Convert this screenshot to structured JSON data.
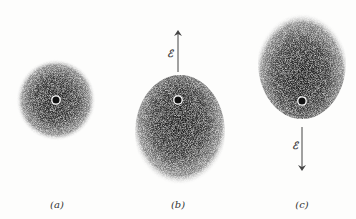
{
  "figure": {
    "panels": [
      {
        "id": "a",
        "label": "(a)",
        "description": "unperturbed atom, spherical electron cloud",
        "cloud": {
          "cx": 56,
          "cy": 100,
          "rx": 40,
          "ry": 41
        },
        "nucleus": {
          "cx": 56,
          "cy": 100
        },
        "label_pos": {
          "x": 57,
          "y": 199
        }
      },
      {
        "id": "b",
        "label": "(b)",
        "description": "field points up, cloud displaced downward",
        "cloud": {
          "cx": 180,
          "cy": 133,
          "rx": 45,
          "ry": 58
        },
        "nucleus": {
          "cx": 178,
          "cy": 100
        },
        "field": {
          "symbol": "ℰ",
          "direction": "up",
          "x": 178,
          "y1": 72,
          "y2": 33,
          "sym_x": 170,
          "sym_y": 53
        },
        "label_pos": {
          "x": 178,
          "y": 199
        }
      },
      {
        "id": "c",
        "label": "(c)",
        "description": "field points down, cloud displaced upward",
        "cloud": {
          "cx": 302,
          "cy": 62,
          "rx": 44,
          "ry": 57
        },
        "nucleus": {
          "cx": 302,
          "cy": 101
        },
        "field": {
          "symbol": "ℰ",
          "direction": "down",
          "x": 302,
          "y1": 127,
          "y2": 168,
          "sym_x": 295,
          "sym_y": 145
        },
        "label_pos": {
          "x": 302,
          "y": 199
        }
      }
    ],
    "colors": {
      "background": "#fdfdfc",
      "cloud_core": "#2a2a2a",
      "cloud_edge": "#ffffff",
      "nucleus_fill": "#111111",
      "nucleus_ring": "#ffffff",
      "arrow": "#444444"
    }
  }
}
